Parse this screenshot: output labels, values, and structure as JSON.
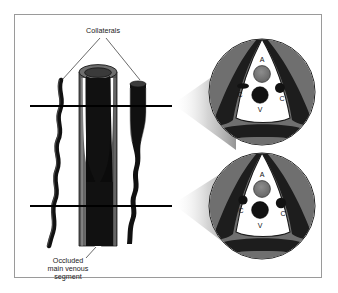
{
  "figure": {
    "background": "#ffffff",
    "border_color": "#9a9a9a"
  },
  "labels": {
    "collaterals": "Collaterals",
    "occluded_line1": "Occluded",
    "occluded_line2": "main venous",
    "occluded_line3": "segment"
  },
  "cross_sections": {
    "upper": {
      "artery": "A",
      "vein": "V",
      "collateral_left": "C",
      "collateral_right": "C"
    },
    "lower": {
      "artery": "A",
      "vein": "V",
      "collateral_left": "C",
      "collateral_right": "C"
    }
  },
  "colors": {
    "muscle_gray": "#6f6f6f",
    "vessel_black": "#111111",
    "artery_gray": "#787878",
    "tube_gray": "#6a6a6a",
    "outline": "#1a1a1a",
    "shadow": "#b8b8b8",
    "white": "#ffffff"
  }
}
